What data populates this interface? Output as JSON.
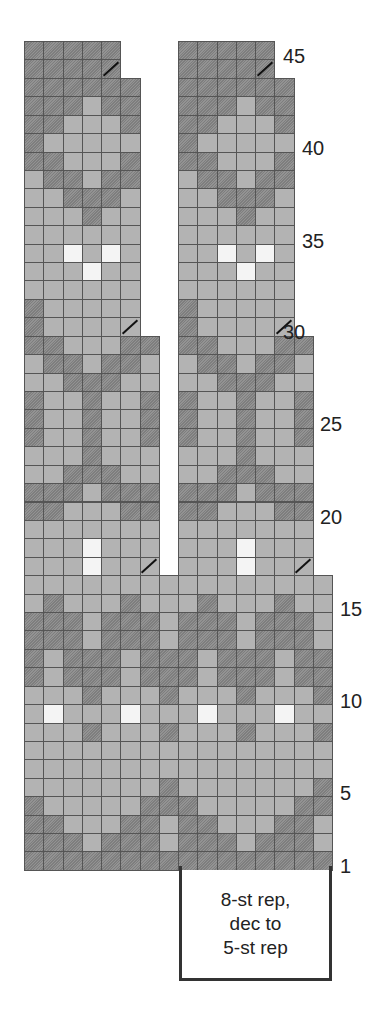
{
  "chart_data": {
    "type": "table",
    "legend": {
      "D": "dark (hatched) color",
      "M": "medium gray color",
      "W": "white/light color",
      "/": "decrease"
    },
    "geometry": {
      "left": 24,
      "top": 41,
      "cell_w": 19.25,
      "cell_h": 18.42,
      "total_rows": 45,
      "total_cols": 16
    },
    "row_labels": [
      1,
      5,
      10,
      15,
      20,
      25,
      30,
      35,
      40,
      45
    ],
    "segments": [
      {
        "rows": [
          1,
          16
        ],
        "col_ranges": [
          [
            0,
            15
          ]
        ]
      },
      {
        "rows": [
          17,
          29
        ],
        "col_ranges": [
          [
            0,
            6
          ],
          [
            8,
            14
          ]
        ]
      },
      {
        "rows": [
          30,
          43
        ],
        "col_ranges": [
          [
            0,
            5
          ],
          [
            8,
            13
          ]
        ]
      },
      {
        "rows": [
          44,
          45
        ],
        "col_ranges": [
          [
            0,
            4
          ],
          [
            8,
            12
          ]
        ]
      }
    ],
    "decreases": [
      {
        "row": 17,
        "cols": [
          6,
          14
        ]
      },
      {
        "row": 30,
        "cols": [
          5,
          13
        ]
      },
      {
        "row": 44,
        "cols": [
          4,
          12
        ]
      }
    ],
    "rows": {
      "1": "DDDDDDDDDDDDDDDD",
      "2": "DDDMDDDMDDDMDDDM",
      "3": "DDMMMDDMDDMMMDDM",
      "4": "DMMMMMDDDMMMMMDD",
      "5": "MMMMMMMDMMMMMMMD",
      "6": "MMMMMMMMMMMMMMMM",
      "7": "MMMMMMMMMMMMMMMM",
      "8": "MMMDMMMDMMMDMMMD",
      "9": "MWMMMWMMMWMMMWMM",
      "10": "MMMDMMMDMMMDMMMD",
      "11": "DMDDDMDDDMDDDMDD",
      "12": "DMDDDMDDDMDDDMDD",
      "13": "DDDMDDDMDDDMDDDM",
      "14": "DDDMDDDMDDDMDDDM",
      "15": "MDMMMDMMMDMMMDMM",
      "16": "MMMMMMMMMMMMMMMM",
      "17": "MMMWMMM",
      "18": "MMMWMMM",
      "19": "MMMMMMM",
      "20": "DDMMMDD",
      "21": "DDDMDDD",
      "22": "MMDDDMM",
      "23": "MMMDMMM",
      "24": "DMMDMMD",
      "25": "DMMDMMD",
      "26": "DMMDMMD",
      "27": "MMDDDMM",
      "28": "MDDMDDM",
      "29": "DDMMMDD",
      "30": "DMMMMM",
      "31": "DMMMMM",
      "32": "MMMMMM",
      "33": "MMMWMM",
      "34": "MMWMWM",
      "35": "MMMMMM",
      "36": "MMMDMM",
      "37": "MMDDDM",
      "38": "MDDMDD",
      "39": "DDMMMD",
      "40": "DMMMMM",
      "41": "DDMMMD",
      "42": "DDDMDD",
      "43": "DDDDDD",
      "44": "DDDDD",
      "45": "DDDDD"
    }
  },
  "labels": {
    "row_1": "1",
    "row_5": "5",
    "row_10": "10",
    "row_15": "15",
    "row_20": "20",
    "row_25": "25",
    "row_30": "30",
    "row_35": "35",
    "row_40": "40",
    "row_45": "45"
  },
  "repeat_box": {
    "line1": "8-st rep,",
    "line2": "dec to",
    "line3": "5-st rep"
  }
}
